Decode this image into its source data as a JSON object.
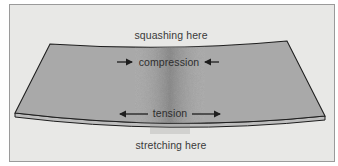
{
  "diagram": {
    "labels": {
      "top": "squashing here",
      "compression": "compression",
      "tension": "tension",
      "bottom": "stretching here"
    },
    "arrows": {
      "compression": "inward",
      "tension": "outward"
    },
    "colors": {
      "frame_background": "#e8e8e6",
      "frame_border": "#9a9a9a",
      "slab_top": "#a9a9a9",
      "slab_edge": "#bdbdbd",
      "slab_center_shade": "#8a8a8a",
      "outline": "#1e1e1e",
      "text": "#3a3a3a"
    }
  }
}
